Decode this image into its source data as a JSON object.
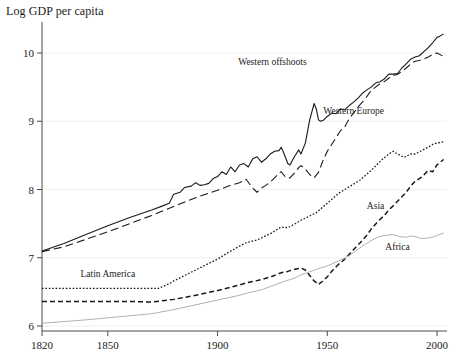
{
  "chart_data": {
    "type": "line",
    "title": "Log GDP per capita",
    "xlabel": "",
    "ylabel": "",
    "xlim": [
      1820,
      2003
    ],
    "ylim": [
      5.9,
      10.45
    ],
    "grid": true,
    "grid_axis": "y",
    "legend_position": "inline-annotations",
    "xticks": [
      1820,
      1850,
      1900,
      1950,
      2000
    ],
    "xtick_labels": [
      "1820",
      "1850",
      "1900",
      "1950",
      "2000"
    ],
    "yticks": [
      6,
      7,
      8,
      9,
      10
    ],
    "ytick_labels": [
      "6",
      "7",
      "8",
      "9",
      "10"
    ],
    "series": [
      {
        "name": "Western offshoots",
        "style": "solid",
        "color": "#1a1a1a",
        "label_x": 1925,
        "label_y": 9.82,
        "x": [
          1820,
          1830,
          1840,
          1850,
          1860,
          1870,
          1875,
          1878,
          1880,
          1883,
          1885,
          1888,
          1890,
          1892,
          1894,
          1896,
          1898,
          1900,
          1902,
          1904,
          1906,
          1908,
          1910,
          1912,
          1914,
          1916,
          1918,
          1920,
          1922,
          1924,
          1926,
          1928,
          1929,
          1930,
          1932,
          1933,
          1935,
          1937,
          1938,
          1940,
          1942,
          1944,
          1945,
          1946,
          1947,
          1948,
          1950,
          1952,
          1954,
          1956,
          1958,
          1960,
          1962,
          1964,
          1966,
          1968,
          1970,
          1972,
          1974,
          1976,
          1978,
          1980,
          1982,
          1984,
          1986,
          1988,
          1990,
          1992,
          1994,
          1996,
          1998,
          2000,
          2001,
          2003
        ],
        "y": [
          7.1,
          7.21,
          7.34,
          7.47,
          7.59,
          7.7,
          7.76,
          7.8,
          7.93,
          7.96,
          8.03,
          8.05,
          8.1,
          8.06,
          8.07,
          8.09,
          8.16,
          8.19,
          8.26,
          8.22,
          8.33,
          8.26,
          8.36,
          8.38,
          8.33,
          8.45,
          8.48,
          8.4,
          8.45,
          8.52,
          8.56,
          8.57,
          8.62,
          8.55,
          8.38,
          8.36,
          8.48,
          8.58,
          8.52,
          8.68,
          9.02,
          9.26,
          9.18,
          9.02,
          9.0,
          9.01,
          9.07,
          9.12,
          9.11,
          9.18,
          9.17,
          9.23,
          9.28,
          9.34,
          9.41,
          9.46,
          9.5,
          9.56,
          9.58,
          9.62,
          9.69,
          9.69,
          9.7,
          9.78,
          9.84,
          9.91,
          9.94,
          9.96,
          10.02,
          10.08,
          10.15,
          10.23,
          10.24,
          10.28
        ]
      },
      {
        "name": "Western Europe",
        "style": "long-dash",
        "color": "#1a1a1a",
        "label_x": 1962,
        "label_y": 9.1,
        "x": [
          1820,
          1830,
          1840,
          1850,
          1860,
          1870,
          1880,
          1890,
          1900,
          1905,
          1910,
          1913,
          1916,
          1918,
          1920,
          1922,
          1924,
          1926,
          1928,
          1929,
          1931,
          1933,
          1935,
          1937,
          1938,
          1940,
          1942,
          1944,
          1946,
          1948,
          1950,
          1952,
          1954,
          1956,
          1958,
          1960,
          1962,
          1964,
          1966,
          1968,
          1970,
          1972,
          1974,
          1976,
          1978,
          1980,
          1982,
          1984,
          1986,
          1988,
          1990,
          1992,
          1994,
          1996,
          1998,
          2000,
          2003
        ],
        "y": [
          7.09,
          7.16,
          7.27,
          7.38,
          7.5,
          7.62,
          7.75,
          7.88,
          7.99,
          8.05,
          8.1,
          8.15,
          8.02,
          7.96,
          8.02,
          8.06,
          8.11,
          8.17,
          8.24,
          8.26,
          8.18,
          8.17,
          8.24,
          8.32,
          8.35,
          8.3,
          8.22,
          8.17,
          8.25,
          8.42,
          8.56,
          8.66,
          8.76,
          8.86,
          8.92,
          9.04,
          9.12,
          9.21,
          9.28,
          9.36,
          9.45,
          9.5,
          9.55,
          9.58,
          9.63,
          9.67,
          9.69,
          9.73,
          9.78,
          9.84,
          9.88,
          9.89,
          9.91,
          9.94,
          9.98,
          10.0,
          9.95
        ]
      },
      {
        "name": "Latin America",
        "style": "dotted",
        "color": "#1a1a1a",
        "label_x": 1850,
        "label_y": 6.72,
        "x": [
          1820,
          1840,
          1860,
          1870,
          1873,
          1878,
          1880,
          1885,
          1890,
          1895,
          1900,
          1905,
          1910,
          1913,
          1918,
          1920,
          1925,
          1929,
          1932,
          1935,
          1938,
          1940,
          1945,
          1950,
          1955,
          1960,
          1965,
          1970,
          1975,
          1978,
          1980,
          1982,
          1985,
          1988,
          1990,
          1993,
          1996,
          1998,
          2000,
          2003
        ],
        "y": [
          6.55,
          6.55,
          6.55,
          6.55,
          6.55,
          6.62,
          6.66,
          6.74,
          6.82,
          6.9,
          6.98,
          7.08,
          7.17,
          7.22,
          7.26,
          7.29,
          7.37,
          7.45,
          7.44,
          7.49,
          7.55,
          7.58,
          7.66,
          7.8,
          7.94,
          8.04,
          8.14,
          8.28,
          8.44,
          8.52,
          8.56,
          8.52,
          8.47,
          8.52,
          8.52,
          8.57,
          8.62,
          8.66,
          8.68,
          8.7
        ]
      },
      {
        "name": "Asia",
        "style": "dash",
        "color": "#1a1a1a",
        "label_x": 1972,
        "label_y": 7.72,
        "x": [
          1820,
          1840,
          1860,
          1870,
          1880,
          1890,
          1900,
          1910,
          1913,
          1920,
          1925,
          1929,
          1932,
          1935,
          1938,
          1940,
          1942,
          1944,
          1946,
          1948,
          1950,
          1952,
          1955,
          1958,
          1960,
          1962,
          1965,
          1968,
          1970,
          1973,
          1976,
          1978,
          1980,
          1983,
          1986,
          1988,
          1990,
          1993,
          1996,
          1998,
          2000,
          2003
        ],
        "y": [
          6.36,
          6.36,
          6.36,
          6.35,
          6.39,
          6.45,
          6.52,
          6.6,
          6.63,
          6.68,
          6.73,
          6.78,
          6.8,
          6.83,
          6.85,
          6.82,
          6.74,
          6.66,
          6.61,
          6.66,
          6.72,
          6.8,
          6.9,
          6.98,
          7.05,
          7.12,
          7.22,
          7.33,
          7.42,
          7.53,
          7.62,
          7.7,
          7.76,
          7.86,
          7.96,
          8.05,
          8.12,
          8.18,
          8.28,
          8.26,
          8.36,
          8.44
        ]
      },
      {
        "name": "Africa",
        "style": "solid-thin",
        "color": "#b0b0b0",
        "label_x": 1982,
        "label_y": 7.12,
        "x": [
          1820,
          1840,
          1860,
          1870,
          1880,
          1890,
          1900,
          1910,
          1913,
          1920,
          1925,
          1930,
          1935,
          1938,
          1940,
          1945,
          1950,
          1955,
          1960,
          1963,
          1966,
          1968,
          1970,
          1973,
          1975,
          1977,
          1980,
          1983,
          1986,
          1988,
          1990,
          1993,
          1996,
          1998,
          2000,
          2003
        ],
        "y": [
          6.04,
          6.09,
          6.15,
          6.18,
          6.24,
          6.31,
          6.38,
          6.45,
          6.48,
          6.53,
          6.59,
          6.65,
          6.7,
          6.75,
          6.77,
          6.83,
          6.88,
          6.95,
          7.03,
          7.1,
          7.17,
          7.21,
          7.25,
          7.3,
          7.32,
          7.33,
          7.34,
          7.31,
          7.3,
          7.32,
          7.31,
          7.28,
          7.29,
          7.3,
          7.33,
          7.36
        ]
      }
    ]
  }
}
